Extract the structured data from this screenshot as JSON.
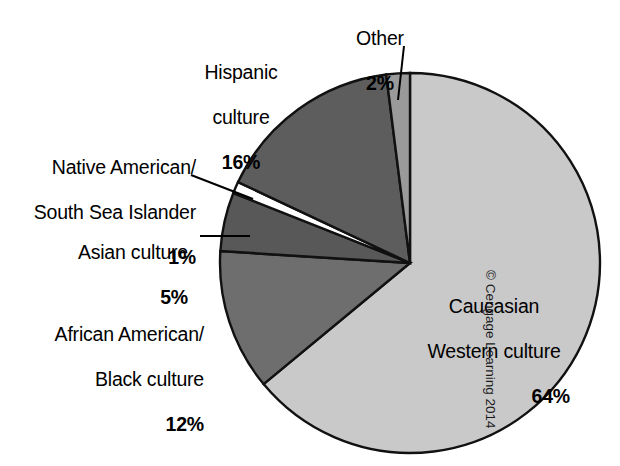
{
  "figure": {
    "width": 620,
    "height": 466,
    "background": "#ffffff",
    "credit": "© Cengage Learning 2014"
  },
  "chart_data": {
    "type": "pie",
    "title": "",
    "subtitle": "",
    "xlabel": "",
    "ylabel": "",
    "legend_position": "callout-labels",
    "grid": false,
    "units": "percent",
    "total": 100,
    "start_angle_deg": 0,
    "direction": "clockwise",
    "center": {
      "x": 410,
      "y": 263
    },
    "radius": 190,
    "categories": [
      "Caucasian Western culture",
      "African American/ Black culture",
      "Asian culture",
      "Native American/ South Sea Islander",
      "Hispanic culture",
      "Other"
    ],
    "values": [
      64,
      12,
      5,
      1,
      16,
      2
    ],
    "slices": [
      {
        "key": "caucasian",
        "label_line1": "Caucasian",
        "label_line2": "Western culture",
        "label_full": "Caucasian Western culture",
        "percent_text": "64%",
        "value": 64,
        "color": "#c9c9c9",
        "start_deg": 0,
        "end_deg": 230.4
      },
      {
        "key": "african-american",
        "label_line1": "African American/",
        "label_line2": "Black culture",
        "label_full": "African American/ Black culture",
        "percent_text": "12%",
        "value": 12,
        "color": "#6e6e6e",
        "start_deg": 230.4,
        "end_deg": 273.6
      },
      {
        "key": "asian",
        "label_line1": "Asian culture",
        "label_line2": "",
        "label_full": "Asian culture",
        "percent_text": "5%",
        "value": 5,
        "color": "#585858",
        "start_deg": 273.6,
        "end_deg": 291.6
      },
      {
        "key": "native-american",
        "label_line1": "Native American/",
        "label_line2": "South Sea Islander",
        "label_full": "Native American/ South Sea Islander",
        "percent_text": "1%",
        "value": 1,
        "color": "#ffffff",
        "start_deg": 291.6,
        "end_deg": 295.2
      },
      {
        "key": "hispanic",
        "label_line1": "Hispanic",
        "label_line2": "culture",
        "label_full": "Hispanic culture",
        "percent_text": "16%",
        "value": 16,
        "color": "#5d5d5d",
        "start_deg": 295.2,
        "end_deg": 352.8
      },
      {
        "key": "other",
        "label_line1": "Other",
        "label_line2": "",
        "label_full": "Other",
        "percent_text": "2%",
        "value": 2,
        "color": "#9a9a9a",
        "start_deg": 352.8,
        "end_deg": 360
      }
    ],
    "stroke_color": "#111111",
    "stroke_width": 2.4
  }
}
